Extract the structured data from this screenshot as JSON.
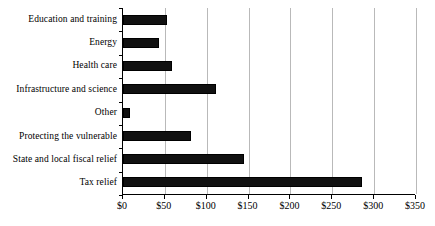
{
  "chart_data": {
    "type": "bar",
    "orientation": "horizontal",
    "title": "",
    "subtitle": "",
    "xlabel": "",
    "ylabel": "",
    "categories": [
      "Education and training",
      "Energy",
      "Health care",
      "Infrastructure and science",
      "Other",
      "Protecting the vulnerable",
      "State and local fiscal relief",
      "Tax relief"
    ],
    "values": [
      53,
      43,
      59,
      111,
      8,
      81,
      144,
      286
    ],
    "xlim": [
      0,
      350
    ],
    "xticks": [
      0,
      50,
      100,
      150,
      200,
      250,
      300,
      350
    ],
    "xtick_labels": [
      "$0",
      "$50",
      "$100",
      "$150",
      "$200",
      "$250",
      "$300",
      "$350"
    ],
    "grid": "vertical",
    "legend": "none",
    "bar_color": "#111111",
    "bar_edge_color": "#000000",
    "gridline_color": "#b9b9b9",
    "axis_color": "#000000",
    "background_color": "#ffffff"
  }
}
